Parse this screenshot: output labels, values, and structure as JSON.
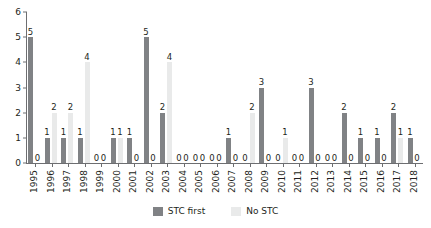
{
  "chart_data": {
    "type": "bar",
    "title": "",
    "subtitle": "",
    "xlabel": "",
    "ylabel": "",
    "ylim": [
      0,
      6
    ],
    "yticks": [
      "0",
      "1",
      "2",
      "3",
      "4",
      "5",
      "6"
    ],
    "grid": false,
    "legend_position": "bottom-center",
    "categories": [
      "1995",
      "1996",
      "1997",
      "1998",
      "1999",
      "2000",
      "2001",
      "2002",
      "2003",
      "2004",
      "2005",
      "2006",
      "2007",
      "2008",
      "2009",
      "2010",
      "2011",
      "2012",
      "2013",
      "2014",
      "2015",
      "2016",
      "2017",
      "2018"
    ],
    "series": [
      {
        "name": "STC first",
        "color": "#808285",
        "values": [
          5,
          1,
          1,
          1,
          0,
          1,
          1,
          5,
          2,
          0,
          0,
          0,
          1,
          0,
          3,
          0,
          0,
          3,
          0,
          2,
          1,
          1,
          2,
          1
        ]
      },
      {
        "name": "No STC",
        "color": "#e9eaea",
        "values": [
          0,
          2,
          2,
          4,
          0,
          1,
          0,
          0,
          4,
          0,
          0,
          0,
          0,
          2,
          0,
          1,
          0,
          0,
          0,
          0,
          0,
          0,
          1,
          0
        ]
      }
    ]
  },
  "legend": {
    "items": [
      {
        "label": "STC first",
        "color": "#808285"
      },
      {
        "label": "No STC",
        "color": "#e9eaea"
      }
    ]
  },
  "axis_colors": {
    "line": "#6d6e71",
    "text": "#231f20"
  }
}
